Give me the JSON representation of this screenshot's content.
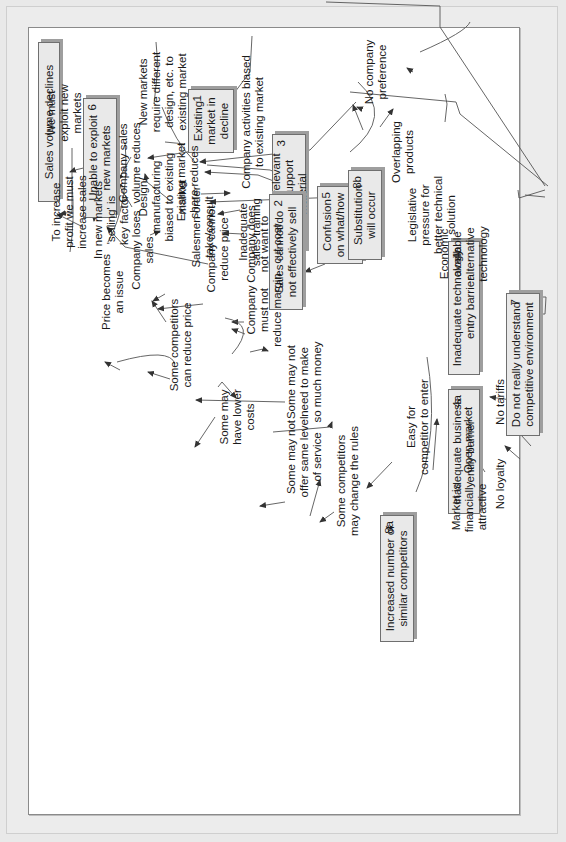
{
  "diagram": {
    "type": "cause-effect (why-why) tree",
    "orientation": "rotated 90 degrees counter-clockwise",
    "colors": {
      "box_fill": "#e9e9e9",
      "box_border": "#6f6f6f",
      "box_shadow": "#9e9e9e",
      "line": "#555555",
      "background": "#ffffff",
      "frame": "#ececec"
    },
    "boxes": {
      "sales_volume_declines": {
        "text": "Sales volume declines"
      },
      "unable_to_exploit": {
        "text": "Unable to exploit\nnew markets",
        "num": "6"
      },
      "lack_support": {
        "text": "Lack of relevant\nsales support material",
        "num": "3"
      },
      "confusion": {
        "text": "Confusion\non what/how\nto sell",
        "num": "5"
      },
      "existing_decline": {
        "text": "Existing\nmarket in\ndecline",
        "num": "1"
      },
      "sales_cannot_sell": {
        "text": "Sales cannot/do\nnot effectively sell",
        "num": "2"
      },
      "substitution": {
        "text": "Substitution\nwill occur",
        "num": "8b"
      },
      "inadequate_technology": {
        "text": "Inadequate technology\nentry barrier",
        "num": "4b"
      },
      "do_not_understand": {
        "text": "Do not really understand\ncompetitive environment",
        "num": "7"
      },
      "inadequate_business": {
        "text": "Inadequate business\nentry barrier",
        "num": "4a"
      },
      "increased_competitors": {
        "text": "Increased number of\nsimilar competitors",
        "num": "8a"
      }
    },
    "labels": {
      "new_markets_require": "New markets\nrequire different\ndesign, etc. to\nexisting market",
      "design_manufacturing": "Design/\nmanufacturing\nbiased to existing\nmarket",
      "company_activities": "Company activities biased\nto existing market",
      "salesmen_order": "Salesmen order\ntake/consult",
      "inadequate_training": "Inadequate\nsales training",
      "no_company_preference": "No company\npreference",
      "overlapping_products": "Overlapping\nproducts",
      "legislative_pressure": "Legislative\npressure for\nbetter technical\nsolution",
      "economic_alternative": "Economic\navailable\nalternative\ntechnology",
      "in_new_markets": "In new markets\n'selling' is\nkey factor",
      "we_must_exploit": "We must\nexploit new\nmarkets",
      "company_sales_volume": "Company sales\nvolume reduces",
      "existing_share": "Existing market\nshare reduces",
      "to_increase_profit": "To increase\nprofit we must\nincrease sales",
      "company_loses_sales": "Company loses\nsales",
      "company_cannot_reduce": "Company cannot\nreduce price",
      "company_not_cut_cost": "Company does\nnot want to\ncut cost",
      "company_must_not": "Company\nmust not\nreduce margin",
      "price_issue": "Price becomes\nan issue",
      "competitors_reduce_price": "Some competitors\ncan reduce price",
      "lower_costs": "Some may\nhave lower\ncosts",
      "not_same_service": "Some may not\noffer same level\nof service",
      "not_much_money": "Some may not\nneed to make\nso much money",
      "change_rules": "Some competitors\nmay change the rules",
      "easy_for_competitor": "Easy for\ncompetitor to enter",
      "market_attractive": "Market is\nfinancially\nattractive",
      "open_market": "Open market",
      "no_loyalty": "No loyalty",
      "no_tariffs": "No tariffs"
    }
  }
}
